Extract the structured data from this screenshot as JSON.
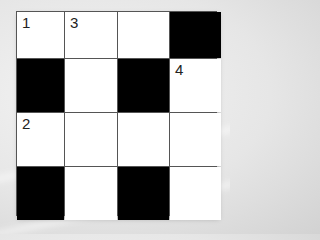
{
  "puzzle": {
    "type": "crossword",
    "rows": 4,
    "cols": 4,
    "colors": {
      "black": "#000000",
      "white": "#ffffff",
      "grid_line": "#555555"
    },
    "cells": [
      [
        {
          "black": false,
          "number": "1"
        },
        {
          "black": false,
          "number": "3"
        },
        {
          "black": false,
          "number": ""
        },
        {
          "black": true,
          "number": ""
        }
      ],
      [
        {
          "black": true,
          "number": ""
        },
        {
          "black": false,
          "number": ""
        },
        {
          "black": true,
          "number": ""
        },
        {
          "black": false,
          "number": "4"
        }
      ],
      [
        {
          "black": false,
          "number": "2"
        },
        {
          "black": false,
          "number": ""
        },
        {
          "black": false,
          "number": ""
        },
        {
          "black": false,
          "number": ""
        }
      ],
      [
        {
          "black": true,
          "number": ""
        },
        {
          "black": false,
          "number": ""
        },
        {
          "black": true,
          "number": ""
        },
        {
          "black": false,
          "number": ""
        }
      ]
    ]
  }
}
